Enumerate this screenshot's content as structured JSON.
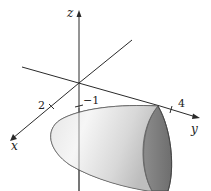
{
  "figure": {
    "axes": {
      "x_label": "x",
      "y_label": "y",
      "z_label": "z"
    },
    "ticks": {
      "x_tick": "2",
      "z_tick": "−1",
      "y_tick": "4"
    },
    "colors": {
      "axis": "#2a2a2a",
      "surface_light": "#f2f2f2",
      "surface_mid": "#c8c8c8",
      "surface_dark": "#7a7a7a"
    }
  }
}
